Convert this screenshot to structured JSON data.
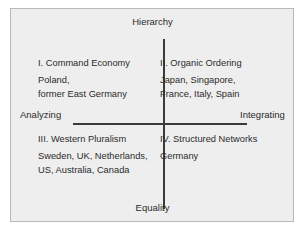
{
  "figure": {
    "colors": {
      "plate_background": "#eeeeee",
      "plate_border": "#b9b9b9",
      "axis": "#3b3b3b",
      "text": "#2b2b2b",
      "page_background": "#ffffff"
    }
  },
  "axes": {
    "vertical": {
      "top_label": "Hierarchy",
      "bottom_label": "Equality"
    },
    "horizontal": {
      "left_label": "Analyzing",
      "right_label": "Integrating"
    }
  },
  "quadrants": [
    {
      "id": "q1",
      "position": "upper-left",
      "title": "I. Command Economy",
      "items": [
        "Poland,",
        "former East Germany"
      ]
    },
    {
      "id": "q2",
      "position": "upper-right",
      "title": "II. Organic Ordering",
      "items": [
        "Japan, Singapore,",
        "France, Italy, Spain"
      ]
    },
    {
      "id": "q3",
      "position": "lower-left",
      "title": "III. Western Pluralism",
      "items": [
        "Sweden, UK, Netherlands,",
        "US, Australia, Canada"
      ]
    },
    {
      "id": "q4",
      "position": "lower-right",
      "title": "IV. Structured Networks",
      "items": [
        "Germany"
      ]
    }
  ]
}
